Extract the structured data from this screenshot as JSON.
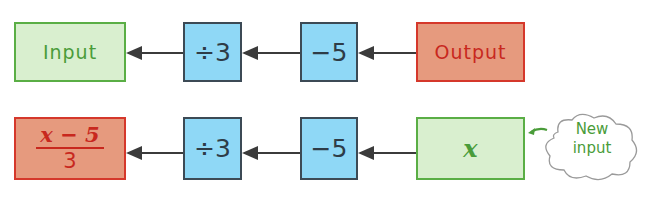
{
  "colors": {
    "input_fill": "#d9efcf",
    "input_border": "#5aae45",
    "op_fill": "#8fd8f6",
    "op_border": "#3c4a55",
    "output_fill": "#e69a7e",
    "output_border": "#d5382b",
    "arrow": "#3b3b3b"
  },
  "row1": {
    "input_label": "Input",
    "op1": "÷3",
    "op2": "−5",
    "output_label": "Output"
  },
  "row2": {
    "result_numerator": "x − 5",
    "result_denominator": "3",
    "op1": "÷3",
    "op2": "−5",
    "input_label": "x",
    "callout_line1": "New",
    "callout_line2": "input"
  }
}
